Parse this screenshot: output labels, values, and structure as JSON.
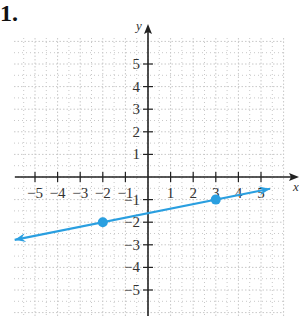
{
  "problem": {
    "number": "1."
  },
  "chart_data": {
    "type": "line",
    "title": "",
    "xlabel": "x",
    "ylabel": "y",
    "xlim": [
      -6,
      6
    ],
    "ylim": [
      -6,
      6
    ],
    "grid": true,
    "x_ticks": [
      -5,
      -4,
      -3,
      -2,
      -1,
      1,
      2,
      3,
      4,
      5
    ],
    "y_ticks": [
      -5,
      -4,
      -3,
      -2,
      -1,
      1,
      2,
      3,
      4,
      5
    ],
    "x_tick_labels": [
      "−5",
      "−4",
      "−3",
      "−2",
      "−1",
      "1",
      "2",
      "3",
      "4",
      "5"
    ],
    "y_tick_labels": [
      "−5",
      "−4",
      "−3",
      "−2",
      "−1",
      "1",
      "2",
      "3",
      "4",
      "5"
    ],
    "series": [
      {
        "name": "line",
        "equation": "y = 0.2x - 1.6",
        "slope": 0.2,
        "intercept": -1.6,
        "x_range": [
          -5.9,
          5.4
        ],
        "arrows": "both",
        "color": "#2a9fe0",
        "points": [
          {
            "x": -2,
            "y": -2
          },
          {
            "x": 3,
            "y": -1
          }
        ]
      }
    ]
  },
  "colors": {
    "axis": "#222222",
    "grid": "#c8c8c8",
    "line": "#2a9fe0",
    "point": "#2a9fe0"
  }
}
